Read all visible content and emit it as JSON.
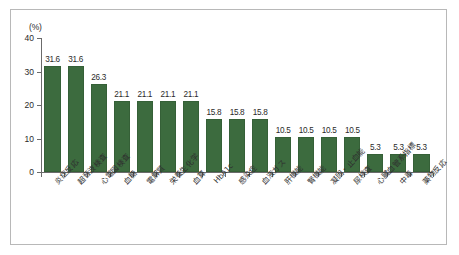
{
  "chart_data": {
    "type": "bar",
    "title": "",
    "xlabel": "",
    "ylabel": "(%)",
    "unit_label": "(%)",
    "ylim": [
      0,
      40
    ],
    "yticks": [
      0,
      10,
      20,
      30,
      40
    ],
    "grid": false,
    "legend": null,
    "bar_color": "#3c6b3e",
    "categories": [
      "炎症反応",
      "超音波検査",
      "心電図検査",
      "血糖",
      "電解質",
      "栄養生化学",
      "血算",
      "HbA1c",
      "感染症",
      "血液ガス",
      "肝機能",
      "腎機能",
      "凝固・止血能",
      "尿検査",
      "心臓血管系指標",
      "中毒",
      "薬物反応"
    ],
    "values": [
      31.6,
      31.6,
      26.3,
      21.1,
      21.1,
      21.1,
      21.1,
      15.8,
      15.8,
      15.8,
      10.5,
      10.5,
      10.5,
      10.5,
      5.3,
      5.3,
      5.3
    ],
    "value_labels": [
      "31.6",
      "31.6",
      "26.3",
      "21.1",
      "21.1",
      "21.1",
      "21.1",
      "15.8",
      "15.8",
      "15.8",
      "10.5",
      "10.5",
      "10.5",
      "10.5",
      "5.3",
      "5.3",
      "5.3"
    ]
  }
}
